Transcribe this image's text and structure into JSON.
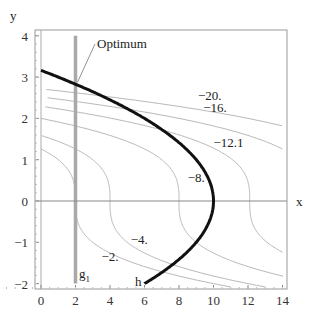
{
  "chart_data": {
    "type": "line",
    "title": "",
    "xlabel": "x",
    "ylabel": "y",
    "xlim": [
      -0.4,
      14.3
    ],
    "ylim": [
      -2.1,
      4.1
    ],
    "xticks": [
      0,
      2,
      4,
      6,
      8,
      10,
      12,
      14
    ],
    "yticks": [
      -2,
      -1,
      0,
      1,
      2,
      3,
      4
    ],
    "grid": false,
    "objective": "f = -x - y^3",
    "contours": [
      {
        "level": -2,
        "label": "-2.",
        "label_pos": [
          3.5,
          -1.35
        ]
      },
      {
        "level": -4,
        "label": "-4.",
        "label_pos": [
          5.2,
          -0.95
        ]
      },
      {
        "level": -8,
        "label": "-8.",
        "label_pos": [
          8.5,
          0.55
        ]
      },
      {
        "level": -12.1,
        "label": "-12.1",
        "label_pos": [
          10.0,
          1.4
        ]
      },
      {
        "level": -16,
        "label": "-16.",
        "label_pos": [
          9.4,
          2.25
        ]
      },
      {
        "level": -20,
        "label": "-20.",
        "label_pos": [
          9.1,
          2.55
        ]
      }
    ],
    "constraints": [
      {
        "name": "h",
        "equation": "x = 10 - y^2",
        "y_range": [
          -2,
          3.162
        ],
        "style": "thick-black",
        "label": "h",
        "label_pos": [
          5.3,
          -1.92
        ]
      },
      {
        "name": "g1",
        "equation": "x = 2",
        "y_range": [
          -2,
          4
        ],
        "style": "thick-gray",
        "label": "g1",
        "label_pos": [
          2.3,
          -1.75
        ]
      },
      {
        "name": "x0",
        "equation": "x = 0",
        "y_range": [
          -2.1,
          4.1
        ],
        "style": "thin-gray"
      }
    ],
    "annotations": [
      {
        "text": "Optimum",
        "point": [
          2,
          2.828
        ],
        "text_pos": [
          3.5,
          3.65
        ]
      }
    ],
    "colors": {
      "contour": "#b8b8b8",
      "h": "#111111",
      "g1": "#a9a9a9",
      "axis": "#888888",
      "frame": "#999999"
    }
  },
  "labels": {
    "x_axis": "x",
    "y_axis": "y",
    "optimum": "Optimum",
    "h": "h",
    "g": "g",
    "g_sub": "1"
  }
}
